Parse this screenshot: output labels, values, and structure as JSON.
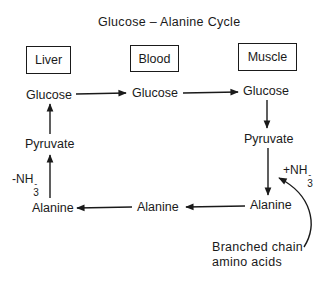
{
  "title": "Glucose – Alanine Cycle",
  "compartments": [
    {
      "id": "liver",
      "label": "Liver"
    },
    {
      "id": "blood",
      "label": "Blood"
    },
    {
      "id": "muscle",
      "label": "Muscle"
    }
  ],
  "nodes": {
    "liver_glucose": "Glucose",
    "blood_glucose": "Glucose",
    "muscle_glucose": "Glucose",
    "liver_pyruvate": "Pyruvate",
    "muscle_pyruvate": "Pyruvate",
    "liver_alanine": "Alanine",
    "blood_alanine": "Alanine",
    "muscle_alanine": "Alanine"
  },
  "annotations": {
    "minus_nh3_prefix": "-NH",
    "plus_nh3_prefix": "+NH",
    "nh3_sub": "3",
    "nh3_sup": "-",
    "bcaa_line1": "Branched chain",
    "bcaa_line2": "amino acids"
  },
  "colors": {
    "ink": "#1a1a1a",
    "background": "#ffffff"
  }
}
